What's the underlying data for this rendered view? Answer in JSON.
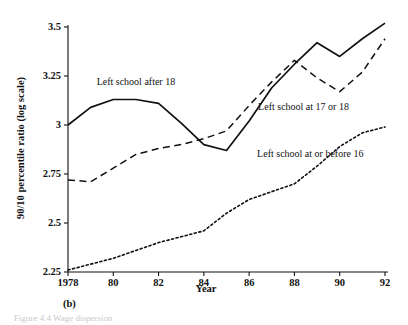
{
  "figure": {
    "panel_label": "(b)",
    "cropped_caption": "Figure 4.4  Wage dispersion"
  },
  "chart_data": {
    "type": "line",
    "title": "",
    "xlabel": "Year",
    "ylabel": "90/10 percentile ratio (log scale)",
    "xlim": [
      1978,
      1992
    ],
    "ylim": [
      2.25,
      3.5
    ],
    "grid": false,
    "legend_position": "inline-annotations",
    "xticks": [
      1978,
      1980,
      1982,
      1984,
      1986,
      1988,
      1990,
      1992
    ],
    "xtick_labels": [
      "1978",
      "80",
      "82",
      "84",
      "86",
      "88",
      "90",
      "92"
    ],
    "yticks": [
      2.25,
      2.5,
      2.75,
      3,
      3.25,
      3.5
    ],
    "ytick_labels": [
      "2.25",
      "2.5",
      "2.75",
      "3",
      "3.25",
      "3.5"
    ],
    "x": [
      1978,
      1979,
      1980,
      1981,
      1982,
      1983,
      1984,
      1985,
      1986,
      1987,
      1988,
      1989,
      1990,
      1991,
      1992
    ],
    "series": [
      {
        "name": "Left school after 18",
        "style": "solid",
        "label_x": 1981.0,
        "label_y": 3.205,
        "values": [
          3.0,
          3.09,
          3.13,
          3.13,
          3.11,
          3.01,
          2.9,
          2.87,
          3.02,
          3.19,
          3.31,
          3.42,
          3.35,
          3.44,
          3.52
        ]
      },
      {
        "name": "Left school at 17 or 18",
        "style": "dashed",
        "label_x": 1988.4,
        "label_y": 3.075,
        "values": [
          2.72,
          2.71,
          2.78,
          2.85,
          2.88,
          2.9,
          2.93,
          2.97,
          3.1,
          3.22,
          3.33,
          3.24,
          3.17,
          3.27,
          3.44
        ]
      },
      {
        "name": "Left school at or before 16",
        "style": "dotted",
        "label_x": 1988.7,
        "label_y": 2.835,
        "values": [
          2.26,
          2.29,
          2.32,
          2.36,
          2.4,
          2.43,
          2.46,
          2.55,
          2.62,
          2.66,
          2.7,
          2.79,
          2.89,
          2.96,
          2.99
        ]
      }
    ]
  }
}
